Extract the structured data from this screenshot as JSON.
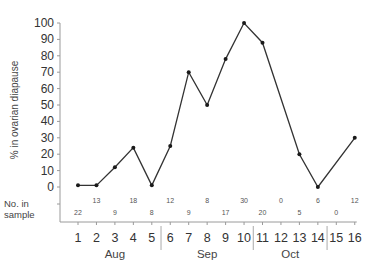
{
  "chart_data": {
    "type": "line",
    "title": "",
    "xlabel": "",
    "ylabel": "% in ovarian diapause",
    "ylim": [
      0,
      100
    ],
    "yticks": [
      0,
      10,
      20,
      30,
      40,
      50,
      60,
      70,
      80,
      90,
      100
    ],
    "x": [
      1,
      2,
      3,
      4,
      5,
      6,
      7,
      8,
      9,
      10,
      11,
      12,
      13,
      14,
      15,
      16
    ],
    "series": [
      {
        "name": "% in ovarian diapause",
        "x": [
          1,
          2,
          3,
          4,
          5,
          6,
          7,
          8,
          9,
          10,
          11,
          13,
          14,
          16
        ],
        "values": [
          1,
          1,
          12,
          24,
          1,
          25,
          70,
          50,
          78,
          100,
          88,
          20,
          0,
          30
        ]
      }
    ],
    "sample_row_label": [
      "No. in",
      "sample"
    ],
    "sample_sizes": [
      22,
      13,
      9,
      18,
      8,
      12,
      9,
      8,
      17,
      30,
      20,
      0,
      5,
      6,
      0,
      12
    ],
    "month_groups": [
      {
        "label": "Aug",
        "from": 1,
        "to": 5
      },
      {
        "label": "Sep",
        "from": 6,
        "to": 10
      },
      {
        "label": "Oct",
        "from": 11,
        "to": 14
      }
    ],
    "grid": false,
    "legend": "none"
  }
}
